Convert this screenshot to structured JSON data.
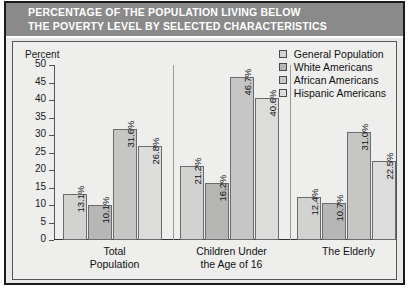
{
  "title": {
    "line1": "PERCENTAGE OF THE POPULATION LIVING BELOW",
    "line2": "THE POVERTY LEVEL BY SELECTED CHARACTERISTICS"
  },
  "axis": {
    "y_label": "Percent",
    "y_ticks": [
      "50",
      "45",
      "40",
      "35",
      "30",
      "25",
      "20",
      "15",
      "10",
      "5",
      "0"
    ]
  },
  "legend": {
    "items": [
      {
        "label": "General Population",
        "swatch": "#d2d2d0"
      },
      {
        "label": "White Americans",
        "swatch": "#b6b6b4"
      },
      {
        "label": "African Americans",
        "swatch": "#c6c6c4"
      },
      {
        "label": "Hispanic Americans",
        "swatch": "#dcdcda"
      }
    ]
  },
  "categories": [
    {
      "line1": "Total",
      "line2": "Population"
    },
    {
      "line1": "Children Under",
      "line2": "the Age of 16"
    },
    {
      "line1": "The Elderly",
      "line2": ""
    }
  ],
  "bar_labels": {
    "g0": [
      "13.1%",
      "10.1%",
      "31.6%",
      "26.8%"
    ],
    "g1": [
      "21.2%",
      "16.2%",
      "46.7%",
      "40.6%"
    ],
    "g2": [
      "12.4%",
      "10.7%",
      "31.0%",
      "22.5%"
    ]
  },
  "colors": {
    "banner": "#8a8a8a",
    "panel": "#e9e9e7",
    "frame": "#1a1a1a",
    "title_text": "#ffffff"
  },
  "chart_data": {
    "type": "bar",
    "title": "PERCENTAGE OF THE POPULATION LIVING BELOW THE POVERTY LEVEL BY SELECTED CHARACTERISTICS",
    "xlabel": "",
    "ylabel": "Percent",
    "ylim": [
      0,
      50
    ],
    "ytick_step": 5,
    "grid": false,
    "legend_position": "top-right",
    "categories": [
      "Total Population",
      "Children Under the Age of 16",
      "The Elderly"
    ],
    "series": [
      {
        "name": "General Population",
        "values": [
          13.1,
          21.2,
          12.4
        ]
      },
      {
        "name": "White Americans",
        "values": [
          10.1,
          16.2,
          10.7
        ]
      },
      {
        "name": "African Americans",
        "values": [
          31.6,
          46.7,
          31.0
        ]
      },
      {
        "name": "Hispanic Americans",
        "values": [
          26.8,
          40.6,
          22.5
        ]
      }
    ],
    "value_label_suffix": "%",
    "value_label_rotation": 90
  }
}
